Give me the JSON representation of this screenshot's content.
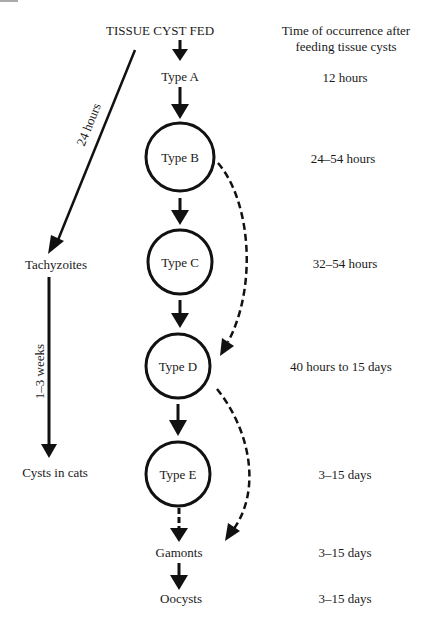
{
  "diagram": {
    "title": "TISSUE CYST FED",
    "time_header_line1": "Time of occurrence after",
    "time_header_line2": "feeding tissue cysts",
    "stages": [
      {
        "label": "Type A",
        "time": "12 hours",
        "circled": false
      },
      {
        "label": "Type B",
        "time": "24–54 hours",
        "circled": true
      },
      {
        "label": "Type C",
        "time": "32–54 hours",
        "circled": true
      },
      {
        "label": "Type D",
        "time": "40 hours to 15 days",
        "circled": true
      },
      {
        "label": "Type E",
        "time": "3–15 days",
        "circled": true
      },
      {
        "label": "Gamonts",
        "time": "3–15 days",
        "circled": false
      },
      {
        "label": "Oocysts",
        "time": "3–15 days",
        "circled": false
      }
    ],
    "side_branch": {
      "first_node": "Tachyzoites",
      "second_node": "Cysts in cats",
      "edge1_label": "24 hours",
      "edge2_label": "1–3 weeks"
    }
  }
}
